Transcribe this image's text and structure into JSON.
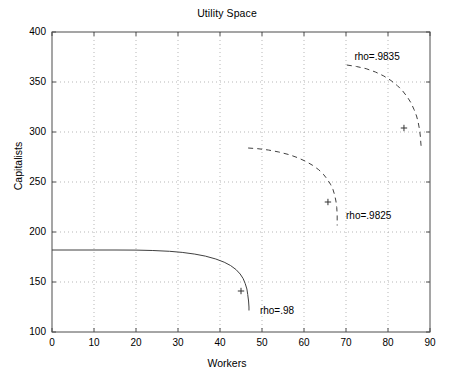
{
  "chart_data": {
    "type": "line",
    "title": "Utility Space",
    "xlabel": "Workers",
    "ylabel": "Capitalists",
    "xlim": [
      0,
      90
    ],
    "ylim": [
      100,
      400
    ],
    "xticks": [
      "0",
      "10",
      "20",
      "30",
      "40",
      "50",
      "60",
      "70",
      "80",
      "90"
    ],
    "yticks": [
      "100",
      "150",
      "200",
      "250",
      "300",
      "350",
      "400"
    ],
    "grid": true,
    "legend": "none",
    "series": [
      {
        "name": "rho=.98",
        "style": "solid",
        "color": "#404040",
        "points": [
          [
            0.0,
            182.0
          ],
          [
            5.0,
            182.0
          ],
          [
            10.0,
            182.0
          ],
          [
            15.0,
            182.0
          ],
          [
            20.0,
            181.9
          ],
          [
            24.0,
            181.5
          ],
          [
            28.0,
            180.7
          ],
          [
            31.0,
            179.6
          ],
          [
            34.0,
            177.9
          ],
          [
            36.5,
            175.9
          ],
          [
            39.0,
            173.0
          ],
          [
            41.0,
            169.8
          ],
          [
            42.5,
            166.5
          ],
          [
            43.8,
            162.5
          ],
          [
            44.8,
            158.0
          ],
          [
            45.5,
            153.5
          ],
          [
            46.0,
            148.5
          ],
          [
            46.4,
            143.0
          ],
          [
            46.6,
            137.5
          ],
          [
            46.8,
            131.0
          ],
          [
            46.9,
            125.0
          ],
          [
            46.9,
            121.5
          ]
        ],
        "marker": {
          "x": 45.0,
          "y": 141.0,
          "symbol": "+"
        },
        "label": "rho=.98",
        "label_x": 49.5,
        "label_y": 121.0
      },
      {
        "name": "rho=.9825",
        "style": "dashed",
        "color": "#404040",
        "points": [
          [
            46.7,
            284.0
          ],
          [
            49.0,
            283.3
          ],
          [
            51.5,
            282.0
          ],
          [
            54.0,
            280.0
          ],
          [
            56.5,
            277.3
          ],
          [
            58.5,
            274.3
          ],
          [
            60.5,
            270.5
          ],
          [
            62.0,
            266.8
          ],
          [
            63.5,
            262.3
          ],
          [
            64.6,
            257.8
          ],
          [
            65.5,
            253.0
          ],
          [
            66.3,
            247.8
          ],
          [
            66.9,
            242.5
          ],
          [
            67.3,
            237.0
          ],
          [
            67.6,
            231.0
          ],
          [
            67.8,
            224.5
          ],
          [
            67.9,
            217.5
          ],
          [
            67.9,
            210.5
          ],
          [
            67.9,
            206.5
          ]
        ],
        "marker": {
          "x": 65.7,
          "y": 230.0,
          "symbol": "+"
        },
        "label": "rho=.9825",
        "label_x": 70.0,
        "label_y": 216.0
      },
      {
        "name": "rho=.9835",
        "style": "dashed",
        "color": "#404040",
        "points": [
          [
            70.2,
            367.0
          ],
          [
            72.5,
            365.5
          ],
          [
            74.8,
            363.3
          ],
          [
            77.0,
            360.0
          ],
          [
            79.0,
            356.0
          ],
          [
            80.7,
            351.5
          ],
          [
            82.2,
            346.5
          ],
          [
            83.5,
            341.0
          ],
          [
            84.6,
            335.0
          ],
          [
            85.5,
            329.0
          ],
          [
            86.2,
            322.5
          ],
          [
            86.8,
            316.0
          ],
          [
            87.2,
            309.5
          ],
          [
            87.5,
            302.5
          ],
          [
            87.7,
            296.0
          ],
          [
            87.8,
            290.0
          ],
          [
            87.9,
            285.0
          ]
        ],
        "marker": {
          "x": 83.8,
          "y": 304.0,
          "symbol": "+"
        },
        "label": "rho=.9835",
        "label_x": 72.0,
        "label_y": 375.0
      }
    ]
  }
}
